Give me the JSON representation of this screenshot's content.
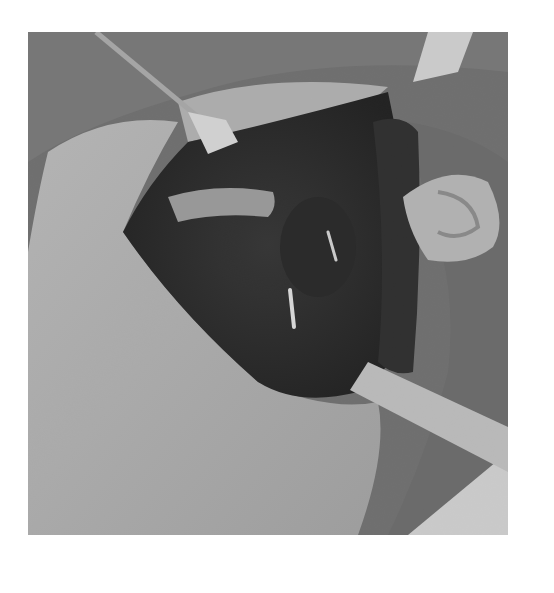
{
  "image": {
    "kind": "photograph",
    "color_mode": "grayscale",
    "subject": "open surgical field of the neck with retractors",
    "frame": {
      "x": 28,
      "y": 32,
      "width": 480,
      "height": 503
    },
    "background_color": "#ffffff",
    "regions": [
      {
        "name": "surgical-drapes",
        "tone": "#6e6e6e"
      },
      {
        "name": "skin-flap-left",
        "tone": "#a9a9a9"
      },
      {
        "name": "wound-cavity",
        "tone": "#2a2a2a"
      },
      {
        "name": "retractor-upper-left",
        "tone": "#d6d6d6"
      },
      {
        "name": "retractor-upper-right",
        "tone": "#d0d0d0"
      },
      {
        "name": "retractor-lower-right",
        "tone": "#bdbdbd"
      },
      {
        "name": "ear",
        "tone": "#b5b5b5"
      },
      {
        "name": "towel-corner",
        "tone": "#cfcfcf"
      }
    ]
  }
}
